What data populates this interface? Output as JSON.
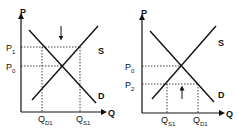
{
  "diagram": {
    "panels": [
      {
        "id": "price-floor",
        "axes": {
          "y_label": "P",
          "x_label": "Q"
        },
        "curves": {
          "supply_label": "S",
          "demand_label": "D"
        },
        "price_levels": [
          {
            "main": "P",
            "sub": "1"
          },
          {
            "main": "P",
            "sub": "0"
          }
        ],
        "quantity_levels": [
          {
            "main": "Q",
            "sub": "D1"
          },
          {
            "main": "Q",
            "sub": "S1"
          }
        ],
        "arrow": "down"
      },
      {
        "id": "price-ceiling",
        "axes": {
          "y_label": "P",
          "x_label": "Q"
        },
        "curves": {
          "supply_label": "S",
          "demand_label": "D"
        },
        "price_levels": [
          {
            "main": "P",
            "sub": "0"
          },
          {
            "main": "P",
            "sub": "2"
          }
        ],
        "quantity_levels": [
          {
            "main": "Q",
            "sub": "S1"
          },
          {
            "main": "Q",
            "sub": "D1"
          }
        ],
        "arrow": "up"
      }
    ],
    "colors": {
      "line": "#111111",
      "background": "#ffffff"
    }
  }
}
